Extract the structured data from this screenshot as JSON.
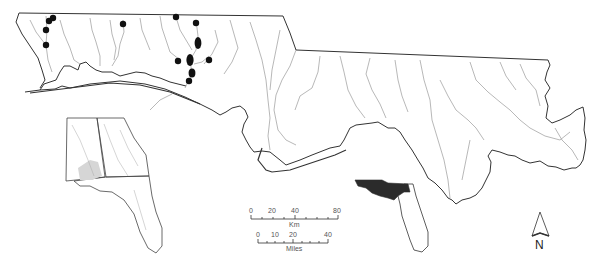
{
  "map": {
    "title": "Study area map of river drainages with sampling localities",
    "colors": {
      "boundary": "#333333",
      "river": "#9a9a9a",
      "site": "#111111",
      "inset_fill": "#2b2b2b",
      "background": "#ffffff"
    },
    "sites": [
      {
        "x": 49,
        "y": 21,
        "rx": 3.2,
        "ry": 3.2
      },
      {
        "x": 53,
        "y": 18,
        "rx": 3.2,
        "ry": 3.2
      },
      {
        "x": 46,
        "y": 30,
        "rx": 3.2,
        "ry": 3.2
      },
      {
        "x": 46,
        "y": 45,
        "rx": 3.2,
        "ry": 3.2
      },
      {
        "x": 123,
        "y": 24,
        "rx": 3.2,
        "ry": 3.2
      },
      {
        "x": 176,
        "y": 17,
        "rx": 3.2,
        "ry": 3.2
      },
      {
        "x": 196,
        "y": 23,
        "rx": 3.2,
        "ry": 3.2
      },
      {
        "x": 198,
        "y": 43,
        "rx": 3.4,
        "ry": 6
      },
      {
        "x": 178,
        "y": 61,
        "rx": 3.2,
        "ry": 3.2
      },
      {
        "x": 190,
        "y": 60,
        "rx": 3.6,
        "ry": 6
      },
      {
        "x": 209,
        "y": 60,
        "rx": 3.2,
        "ry": 3.2
      },
      {
        "x": 192,
        "y": 73,
        "rx": 3.4,
        "ry": 4.5
      },
      {
        "x": 189,
        "y": 81,
        "rx": 3.2,
        "ry": 3.2
      }
    ]
  },
  "scale_bar": {
    "km": {
      "ticks": [
        "0",
        "20",
        "40",
        "80"
      ],
      "unit": "Km"
    },
    "miles": {
      "ticks": [
        "0",
        "10",
        "20",
        "40"
      ],
      "unit": "Miles"
    }
  },
  "north_arrow": {
    "label": "N"
  },
  "insets": {
    "regional": "Alabama, Georgia and Florida inset with study area shaded",
    "state": "Florida inset with panhandle study area filled"
  }
}
